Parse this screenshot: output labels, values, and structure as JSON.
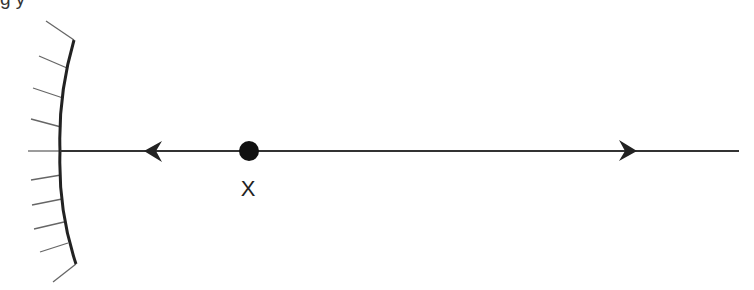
{
  "caption_clipped": "g                                    y",
  "diagram": {
    "type": "concave-mirror-ray-diagram",
    "mirror": {
      "shape": "concave",
      "top": [
        74,
        40
      ],
      "vertex": [
        60,
        151
      ],
      "bottom": [
        76,
        264
      ],
      "hatch_count": 11,
      "color": "#222222"
    },
    "principal_axis": {
      "from": [
        60,
        151
      ],
      "to": [
        739,
        151
      ],
      "color": "#333333"
    },
    "arrows": [
      {
        "name": "arrow-left",
        "direction": "left",
        "tip": [
          144,
          151
        ]
      },
      {
        "name": "arrow-right",
        "direction": "right",
        "tip": [
          637,
          151
        ]
      }
    ],
    "point": {
      "center": [
        249,
        151
      ],
      "radius": 10,
      "color": "#111111"
    },
    "point_label": "X"
  }
}
